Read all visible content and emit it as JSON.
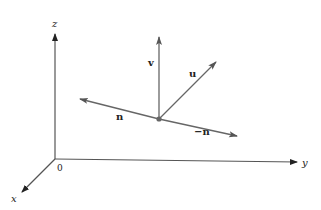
{
  "figure": {
    "colors": {
      "axis": "#555555",
      "vector": "#666666",
      "text": "#222222",
      "point": "#666666"
    },
    "axes": {
      "z_label": "z",
      "y_label": "y",
      "x_label": "x",
      "origin_label": "0"
    },
    "vectors": {
      "v_label": "v",
      "u_label": "u",
      "n_label": "n",
      "neg_n_label": "−n"
    }
  }
}
